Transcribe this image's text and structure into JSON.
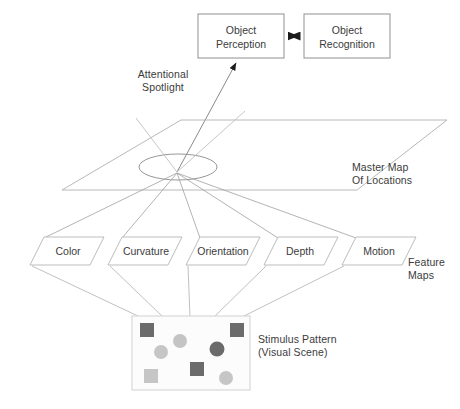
{
  "diagram": {
    "background_color": "#ffffff",
    "line_color": "#9a9a9a",
    "text_color": "#3b3b3b"
  },
  "top_boxes": [
    {
      "id": "object-perception",
      "label": "Object\nPerception",
      "x": 198,
      "y": 14,
      "w": 86,
      "h": 44
    },
    {
      "id": "object-recognition",
      "label": "Object\nRecognition",
      "x": 304,
      "y": 14,
      "w": 86,
      "h": 44
    }
  ],
  "connector": {
    "name": "bidirectional-arrow",
    "label": "",
    "from": "object-perception",
    "to": "object-recognition",
    "double_headed": true
  },
  "spotlight_arrow": {
    "name": "spotlight-to-perception-arrow",
    "from_x": 178,
    "from_y": 173,
    "to_x": 237,
    "to_y": 62,
    "arrowhead": true
  },
  "labels": {
    "attentional_spotlight": "Attentional\nSpotlight",
    "master_map": "Master Map\nOf Locations",
    "feature_maps": "Feature\nMaps",
    "stimulus_pattern": "Stimulus Pattern\n(Visual Scene)"
  },
  "master_map": {
    "name": "master-map-plane",
    "points": "181,120 447,120 357,190 62,190",
    "ellipse": {
      "cx": 178,
      "cy": 167,
      "rx": 39,
      "ry": 13
    }
  },
  "feature_maps": [
    {
      "id": "color",
      "label": "Color",
      "x": 30,
      "y": 237,
      "w": 74,
      "h": 28,
      "skew": 14
    },
    {
      "id": "curvature",
      "label": "Curvature",
      "x": 108,
      "y": 237,
      "w": 74,
      "h": 28,
      "skew": 14
    },
    {
      "id": "orientation",
      "label": "Orientation",
      "x": 186,
      "y": 237,
      "w": 74,
      "h": 28,
      "skew": 14
    },
    {
      "id": "depth",
      "label": "Depth",
      "x": 264,
      "y": 237,
      "w": 74,
      "h": 28,
      "skew": 14
    },
    {
      "id": "motion",
      "label": "Motion",
      "x": 342,
      "y": 237,
      "w": 74,
      "h": 28,
      "skew": 14
    }
  ],
  "stimulus_box": {
    "name": "stimulus-pattern-box",
    "x": 132,
    "y": 316,
    "w": 118,
    "h": 74,
    "fill": "#fcfcfc",
    "border": "#cfcfcf"
  },
  "stimulus_shapes": [
    {
      "type": "square",
      "name": "dark-square-top-left",
      "cx": 147,
      "cy": 330,
      "size": 13,
      "color": "#6b6b6b"
    },
    {
      "type": "square",
      "name": "dark-square-top-right",
      "cx": 237,
      "cy": 330,
      "size": 13,
      "color": "#6b6b6b"
    },
    {
      "type": "circle",
      "name": "light-circle-upper-mid",
      "cx": 180,
      "cy": 340,
      "size": 13,
      "color": "#c4c4c4"
    },
    {
      "type": "circle",
      "name": "light-circle-left",
      "cx": 161,
      "cy": 351,
      "size": 13,
      "color": "#c6c6c6"
    },
    {
      "type": "circle",
      "name": "dark-circle-right",
      "cx": 217,
      "cy": 349,
      "size": 14,
      "color": "#6b6b6b"
    },
    {
      "type": "square",
      "name": "dark-square-center",
      "cx": 197,
      "cy": 369,
      "size": 14,
      "color": "#6b6b6b"
    },
    {
      "type": "square",
      "name": "light-square-bottom-left",
      "cx": 151,
      "cy": 376,
      "size": 14,
      "color": "#c6c6c6"
    },
    {
      "type": "circle",
      "name": "light-circle-bottom",
      "cx": 226,
      "cy": 377,
      "size": 13,
      "color": "#c6c6c6"
    }
  ],
  "spotlight_cone": {
    "apex_x": 178,
    "apex_y": 172,
    "top_points": [
      "137,120",
      "244,113"
    ]
  },
  "map_to_feature_lines": [
    {
      "from_x": 178,
      "from_y": 173,
      "to_x": 44,
      "to_y": 237
    },
    {
      "from_x": 178,
      "from_y": 173,
      "to_x": 122,
      "to_y": 237
    },
    {
      "from_x": 178,
      "from_y": 173,
      "to_x": 200,
      "to_y": 237
    },
    {
      "from_x": 178,
      "from_y": 173,
      "to_x": 278,
      "to_y": 237
    },
    {
      "from_x": 178,
      "from_y": 173,
      "to_x": 356,
      "to_y": 237
    }
  ],
  "feature_to_stimulus_lines": [
    {
      "from_x": 44,
      "from_y": 265,
      "to_x": 140,
      "to_y": 316
    },
    {
      "from_x": 122,
      "from_y": 265,
      "to_x": 160,
      "to_y": 316
    },
    {
      "from_x": 200,
      "from_y": 265,
      "to_x": 185,
      "to_y": 316
    },
    {
      "from_x": 278,
      "from_y": 265,
      "to_x": 212,
      "to_y": 316
    },
    {
      "from_x": 356,
      "from_y": 265,
      "to_x": 240,
      "to_y": 316
    }
  ]
}
